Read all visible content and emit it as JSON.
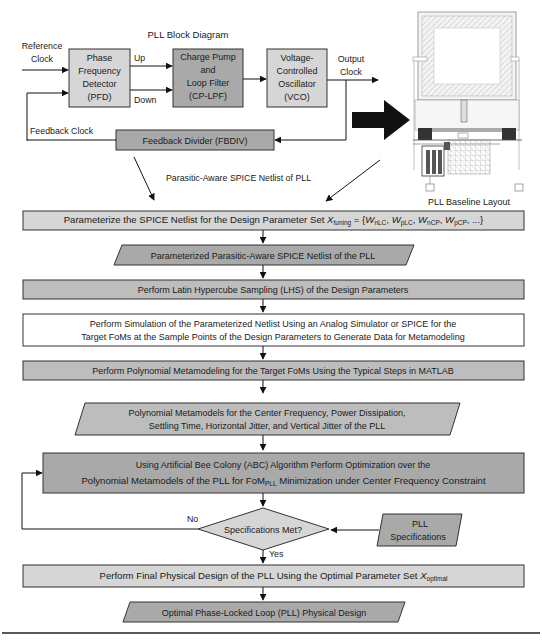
{
  "block_diagram": {
    "title": "PLL Block Diagram",
    "reference_clock": "Reference Clock",
    "reference_clock_lines": [
      "Reference",
      "Clock"
    ],
    "pfd": [
      "Phase",
      "Frequency",
      "Detector",
      "(PFD)"
    ],
    "up": "Up",
    "down": "Down",
    "cp_lpf": [
      "Charge Pump",
      "and",
      "Loop Filter",
      "(CP-LPF)"
    ],
    "vco": [
      "Voltage-",
      "Controlled",
      "Oscillator",
      "(VCO)"
    ],
    "output_clock": [
      "Output",
      "Clock"
    ],
    "feedback_clock": "Feedback Clock",
    "fbdiv": "Feedback Divider (FBDIV)",
    "netlist_label": "Parasitic-Aware SPICE Netlist of PLL"
  },
  "layout_image": {
    "caption": "PLL Baseline Layout"
  },
  "flow": {
    "step1": {
      "text": "Parameterize the SPICE Netlist for the Design Parameter Set ",
      "x": "X",
      "x_sub": "tuning",
      "eq": " = {",
      "params": [
        {
          "sym": "W",
          "sub": "nLC"
        },
        {
          "sym": "W",
          "sub": "pLC"
        },
        {
          "sym": "W",
          "sub": "nCP"
        },
        {
          "sym": "W",
          "sub": "pCP"
        }
      ],
      "tail": ", ...}"
    },
    "data1": "Parameterized Parasitic-Aware SPICE Netlist of the PLL",
    "step2": "Perform Latin Hypercube Sampling (LHS) of the Design Parameters",
    "step3": [
      "Perform Simulation of the Parameterized Netlist Using an Analog Simulator or SPICE for the",
      "Target FoMs at the Sample Points of the Design Parameters to Generate Data for Metamodeling"
    ],
    "step4": "Perform Polynomial Metamodeling for the Target FoMs Using the Typical Steps in MATLAB",
    "data2": [
      "Polynomial Metamodels for the Center Frequency,  Power Dissipation,",
      "Settling Time, Horizontal Jitter, and Vertical Jitter of the PLL"
    ],
    "step5": {
      "line1": "Using Artificial Bee Colony (ABC) Algorithm Perform Optimization over the",
      "line2_a": "Polynomial Metamodels of the PLL for FoM",
      "line2_sub": "PLL",
      "line2_b": " Minimization under Center Frequency Constraint"
    },
    "decision": "Specifications Met?",
    "no": "No",
    "yes": "Yes",
    "specs": [
      "PLL",
      "Specifications"
    ],
    "step6": {
      "text": "Perform Final Physical Design of the PLL Using the Optimal Parameter Set ",
      "x": "X",
      "x_sub": "optimal"
    },
    "final": "Optimal Phase-Locked Loop (PLL) Physical Design"
  },
  "colors": {
    "light_box": "#d6d6d6",
    "dark_box": "#a9a9a9",
    "mid_box": "#bdbdbd",
    "white_box": "#ffffff",
    "stroke": "#333333"
  }
}
